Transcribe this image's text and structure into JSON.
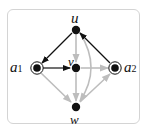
{
  "diagram": {
    "nodes": [
      {
        "id": "u",
        "label": "u",
        "x": 76,
        "y": 30,
        "type": "normal"
      },
      {
        "id": "v",
        "label": "v",
        "x": 76,
        "y": 68,
        "type": "normal"
      },
      {
        "id": "w",
        "label": "w",
        "x": 76,
        "y": 107,
        "type": "normal"
      },
      {
        "id": "a1",
        "label": "a",
        "sub": "1",
        "x": 37,
        "y": 68,
        "type": "double"
      },
      {
        "id": "a2",
        "label": "a",
        "sub": "2",
        "x": 115,
        "y": 68,
        "type": "double"
      }
    ],
    "edges": [
      {
        "from": "u",
        "to": "a1",
        "color": "#111111"
      },
      {
        "from": "a1",
        "to": "v",
        "color": "#111111"
      },
      {
        "from": "a2",
        "to": "u",
        "color": "#111111"
      },
      {
        "from": "u",
        "to": "v",
        "color": "#bdbdbd"
      },
      {
        "from": "v",
        "to": "a2",
        "color": "#bdbdbd"
      },
      {
        "from": "v",
        "to": "w",
        "color": "#bdbdbd"
      },
      {
        "from": "a1",
        "to": "w",
        "color": "#bdbdbd"
      },
      {
        "from": "w",
        "to": "a2",
        "color": "#bdbdbd"
      },
      {
        "from": "u",
        "to": "w",
        "color": "#bdbdbd",
        "curved": true
      }
    ],
    "labels": {
      "u": "u",
      "v": "v",
      "w": "w",
      "a1": "a",
      "a1_sub": "1",
      "a2": "a",
      "a2_sub": "2"
    }
  }
}
